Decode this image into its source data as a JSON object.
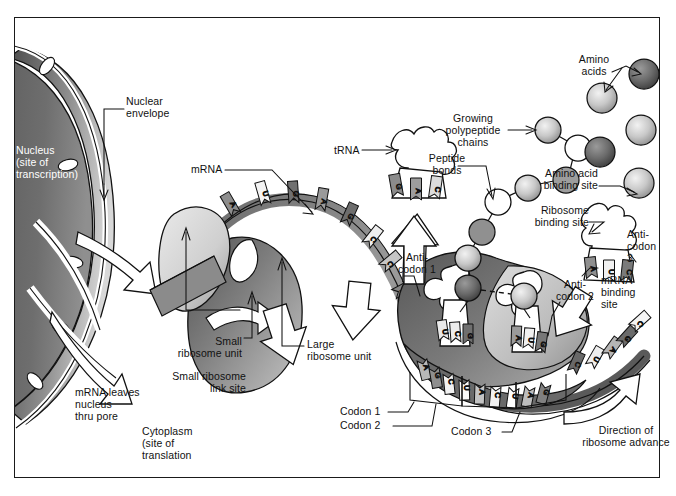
{
  "figure": {
    "border_color": "#1a1a1a",
    "background": "#ffffff"
  },
  "palette": {
    "dark_gray": "#595959",
    "mid_gray": "#8c8c8c",
    "light_gray": "#c9c9c9",
    "pale_gray": "#e2e2e2",
    "outline": "#111111",
    "white": "#ffffff"
  },
  "labels": {
    "nucleus": "Nucleus\n(site of\ntranscription)",
    "nuclear_envelope": "Nuclear\nenvelope",
    "mrna": "mRNA",
    "mrna_leaves": "mRNA leaves\nnucleus\nthru pore",
    "cytoplasm": "Cytoplasm\n(site of\ntranslation",
    "small_ribosome_unit": "Small\nribosome unit",
    "small_ribosome_link_site": "Small ribosome\nlink site",
    "large_ribosome_unit": "Large\nribosome unit",
    "trna": "tRNA",
    "growing_polypeptide_chains": "Growing\npolypeptide\nchains",
    "peptide_bonds": "Peptide\nbonds",
    "amino_acids": "Amino\nacids",
    "amino_acid_binding_site": "Amino acid\nbinding site",
    "ribosome_binding_site": "Ribosome\nbinding site",
    "mrna_binding_site": "mRNA\nbinding\nsite",
    "anticodon_1": "Anti-\ncodon 1",
    "anticodon_2": "Anti-\ncodon 2",
    "anticodon_3": "Anti-\ncodon\n3",
    "codon_1": "Codon 1",
    "codon_2": "Codon 2",
    "codon_3": "Codon 3",
    "direction_of_ribosome_advance": "Direction of\nribosome advance"
  },
  "sequences": {
    "free_trna_anticodon": [
      "G",
      "A",
      "C"
    ],
    "mrna_left_bases": [
      "C",
      "A",
      "U",
      "G",
      "A",
      "G",
      "C",
      "C",
      "A",
      "C"
    ],
    "mrna_codon_1": [
      "A",
      "G",
      "C"
    ],
    "mrna_codon_2": [
      "U",
      "A",
      "C"
    ],
    "mrna_codon_3": [
      "U",
      "A",
      "G"
    ],
    "mrna_right_bases": [
      "C",
      "U",
      "A",
      "G",
      "C"
    ],
    "anticodon_1_bases": [
      "U",
      "C",
      "G"
    ],
    "anticodon_2_bases": [
      "A",
      "U",
      "G"
    ],
    "anticodon_3_bases": [
      "A",
      "U",
      "C"
    ]
  }
}
